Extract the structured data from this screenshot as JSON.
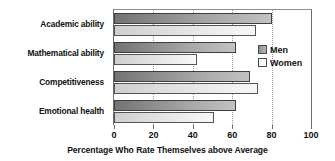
{
  "chart_data": {
    "type": "bar",
    "orientation": "horizontal",
    "title": "",
    "xlabel": "Percentage Who Rate Themselves above Average",
    "ylabel": "",
    "categories": [
      "Academic ability",
      "Mathematical ability",
      "Competitiveness",
      "Emotional health"
    ],
    "series": [
      {
        "name": "Men",
        "values": [
          80,
          62,
          69,
          62
        ],
        "color": "#9a9a9a"
      },
      {
        "name": "Women",
        "values": [
          72,
          42,
          73,
          51
        ],
        "color": "#ececec"
      }
    ],
    "xlim": [
      0,
      100
    ],
    "xticks": [
      0,
      20,
      40,
      60,
      80,
      100
    ],
    "xtick_labels": [
      "0",
      "20",
      "40",
      "60",
      "80",
      "100"
    ],
    "grid": "vertical-dotted",
    "legend_position": "right-inside"
  },
  "legend": {
    "entries": [
      {
        "label": "Men",
        "swatch": "men-swatch"
      },
      {
        "label": "Women",
        "swatch": "women-swatch"
      }
    ]
  }
}
